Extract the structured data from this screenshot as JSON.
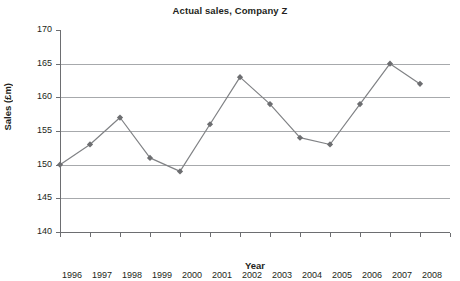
{
  "chart_data": {
    "type": "line",
    "title": "Actual sales, Company Z",
    "xlabel": "Year",
    "ylabel": "Sales (£m)",
    "categories": [
      "1996",
      "1997",
      "1998",
      "1999",
      "2000",
      "2001",
      "2002",
      "2003",
      "2004",
      "2005",
      "2006",
      "2007",
      "2008"
    ],
    "values": [
      150,
      153,
      157,
      151,
      149,
      156,
      163,
      159,
      154,
      153,
      159,
      165,
      162
    ],
    "series": [
      {
        "name": "Actual sales",
        "values": [
          150,
          153,
          157,
          151,
          149,
          156,
          163,
          159,
          154,
          153,
          159,
          165,
          162
        ]
      }
    ],
    "ylim": [
      140,
      170
    ],
    "yticks": [
      140,
      145,
      150,
      155,
      160,
      165,
      170
    ],
    "ytick_labels": [
      "140",
      "145",
      "150",
      "155",
      "160",
      "165",
      "170"
    ],
    "grid": true,
    "gridlines_at": [
      145,
      150,
      155,
      160,
      165
    ],
    "legend": "none",
    "marker": "diamond",
    "colors": {
      "line": "#808285",
      "marker": "#6d6e71",
      "gridline": "#a7a9ac",
      "axis": "#6d6e71",
      "text": "#231f20",
      "background": "#ffffff"
    }
  }
}
